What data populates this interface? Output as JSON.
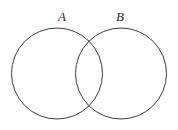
{
  "figure": {
    "type": "venn-diagram",
    "width": 178,
    "height": 130,
    "background_color": "#ffffff",
    "stroke_color": "#3a3a3a",
    "stroke_width": 1,
    "label_color": "#2b2b2b",
    "sets": [
      {
        "id": "set-a",
        "label": "A",
        "center_x": 57,
        "center_y": 73.5,
        "radius": 45.5,
        "label_x": 62,
        "label_y": 21
      },
      {
        "id": "set-b",
        "label": "B",
        "center_x": 121,
        "center_y": 73.5,
        "radius": 45.5,
        "label_x": 120,
        "label_y": 21
      }
    ],
    "regions": [
      {
        "id": "a-only",
        "name": "A only",
        "shaded": false
      },
      {
        "id": "intersection",
        "name": "A intersect B",
        "shaded": false
      },
      {
        "id": "b-only",
        "name": "B only",
        "shaded": false
      }
    ]
  }
}
